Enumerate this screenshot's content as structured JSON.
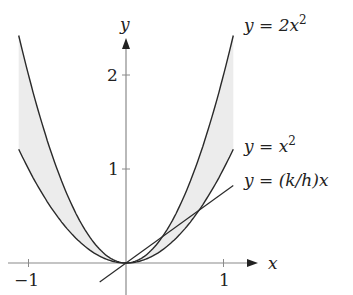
{
  "chart_data": {
    "type": "line",
    "title": "",
    "xlabel": "x",
    "ylabel": "y",
    "xlim": [
      -1.1,
      1.1
    ],
    "ylim": [
      0,
      2.42
    ],
    "x_ticks": [
      {
        "value": -1,
        "label": "−1"
      },
      {
        "value": 1,
        "label": "1"
      }
    ],
    "y_ticks": [
      {
        "value": 1,
        "label": "1"
      },
      {
        "value": 2,
        "label": "2"
      }
    ],
    "series": [
      {
        "name": "y = 2x^2",
        "label": "y = 2x²",
        "function": "2*x^2",
        "domain": [
          -1.1,
          1.1
        ]
      },
      {
        "name": "y = x^2",
        "label": "y = x²",
        "function": "x^2",
        "domain": [
          -1.1,
          1.1
        ]
      },
      {
        "name": "y = (k/h)x",
        "label": "y = (k/h)x",
        "function": "0.75*x",
        "domain": [
          -0.27,
          1.1
        ]
      }
    ],
    "shaded_region": "between y = x^2 and y = 2x^2",
    "grid": false,
    "colors": {
      "curve": "#2a2a2a",
      "axis": "#8a8a8a",
      "shade": "#ececec"
    }
  },
  "labels": {
    "axis_x": "x",
    "axis_y": "y",
    "tick_x_neg1": "−1",
    "tick_x_1": "1",
    "tick_y_1": "1",
    "tick_y_2": "2",
    "curve_2x2_prefix": "y = 2x",
    "curve_2x2_sup": "2",
    "curve_x2_prefix": "y = x",
    "curve_x2_sup": "2",
    "line_label": "y = (k/h)x"
  }
}
